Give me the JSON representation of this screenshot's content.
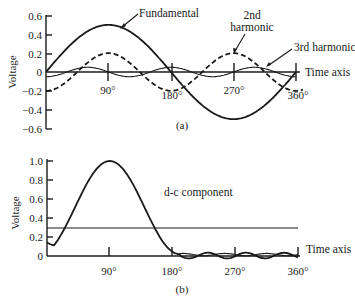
{
  "chart_data": [
    {
      "id": "a",
      "type": "line",
      "caption": "(a)",
      "title": "",
      "xlabel": "Time axis",
      "ylabel": "Voltage",
      "x_ticks": [
        "90°",
        "180°",
        "270°",
        "360°"
      ],
      "y_ticks": [
        "0.6",
        "0.4",
        "0.2",
        "0",
        "-0.2",
        "-0.4",
        "-0.6"
      ],
      "ylim": [
        -0.6,
        0.6
      ],
      "xlim": [
        0,
        360
      ],
      "grid": false,
      "x": [
        0,
        45,
        90,
        135,
        180,
        225,
        270,
        315,
        360
      ],
      "series": [
        {
          "name": "Fundamental",
          "style": "solid",
          "amplitude": 0.5,
          "harmonic": 1,
          "values": [
            0,
            0.354,
            0.5,
            0.354,
            0,
            -0.354,
            -0.5,
            -0.354,
            0
          ]
        },
        {
          "name": "2nd harmonic",
          "style": "dashed",
          "amplitude": 0.2,
          "harmonic": 2,
          "values": [
            -0.2,
            0,
            0.2,
            0,
            -0.2,
            0,
            0.2,
            0,
            -0.2
          ]
        },
        {
          "name": "3rd harmonic",
          "style": "solid",
          "amplitude": 0.05,
          "harmonic": 3,
          "values": [
            -0.05,
            0.035,
            0.05,
            -0.035,
            -0.05,
            0.035,
            0.05,
            -0.035,
            -0.05
          ]
        }
      ],
      "annotations": [
        "Fundamental",
        "2nd harmonic",
        "3rd harmonic",
        "Time axis"
      ]
    },
    {
      "id": "b",
      "type": "line",
      "caption": "(b)",
      "title": "",
      "xlabel": "Time axis",
      "ylabel": "Voltage",
      "x_ticks": [
        "90°",
        "180°",
        "270°",
        "360°"
      ],
      "y_ticks": [
        "1.0",
        "0.8",
        "0.6",
        "0.4",
        "0.2",
        "0"
      ],
      "ylim": [
        0,
        1.0
      ],
      "xlim": [
        0,
        360
      ],
      "grid": false,
      "x": [
        0,
        30,
        60,
        90,
        120,
        150,
        180,
        210,
        240,
        270,
        300,
        330,
        360
      ],
      "series": [
        {
          "name": "Sum waveform",
          "style": "solid",
          "values": [
            0.1,
            0.35,
            0.8,
            1.0,
            0.8,
            0.35,
            0.1,
            -0.02,
            0.03,
            -0.02,
            0.03,
            -0.02,
            0.05
          ]
        },
        {
          "name": "d-c component",
          "style": "solid",
          "values": [
            0.3,
            0.3,
            0.3,
            0.3,
            0.3,
            0.3,
            0.3,
            0.3,
            0.3,
            0.3,
            0.3,
            0.3,
            0.3
          ]
        }
      ],
      "annotations": [
        "d-c component",
        "Time axis"
      ]
    }
  ],
  "labels": {
    "a": {
      "ylabel": "Voltage",
      "yticks": [
        "0.6",
        "0.4",
        "0.2",
        "0",
        "−0.2",
        "−0.4",
        "−0.6"
      ],
      "xticks": [
        "90°",
        "180°",
        "270°",
        "360°"
      ],
      "fundamental": "Fundamental",
      "second_1": "2nd",
      "second_2": "harmonic",
      "third": "3rd harmonic",
      "time_axis": "Time axis",
      "caption": "(a)"
    },
    "b": {
      "ylabel": "Voltage",
      "yticks": [
        "1.0",
        "0.8",
        "0.6",
        "0.4",
        "0.2",
        "0"
      ],
      "xticks": [
        "90°",
        "180°",
        "270°",
        "360°"
      ],
      "dc": "d-c component",
      "time_axis": "Time axis",
      "caption": "(b)"
    }
  }
}
